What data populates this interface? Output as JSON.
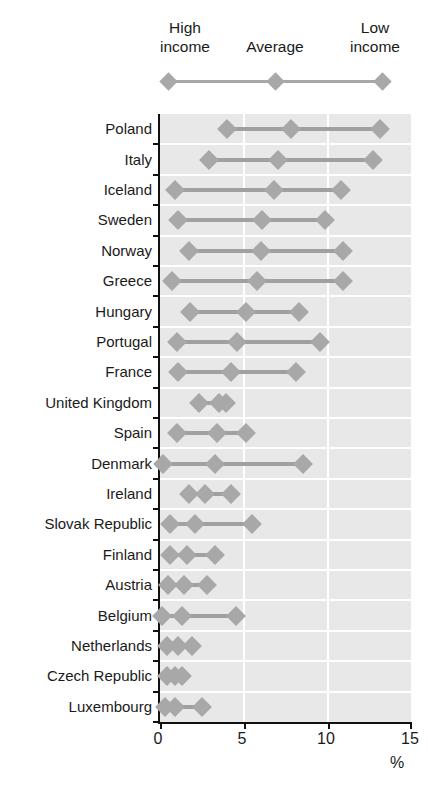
{
  "title": "",
  "legend": {
    "high_income": "High\nincome",
    "average": "Average",
    "low_income": "Low\nincome"
  },
  "axis": {
    "x_ticks": [
      "0",
      "5",
      "10",
      "15"
    ],
    "x_unit": "%"
  },
  "colors": {
    "marker": "#a8a8a8",
    "line": "#a0a0a0",
    "plot_background": "#e8e8e8",
    "gridline": "#ffffff",
    "axis": "#111111",
    "text": "#1a1a1a"
  },
  "chart_data": {
    "type": "scatter",
    "title": "",
    "xlabel": "%",
    "ylabel": "",
    "xlim": [
      0,
      15
    ],
    "x_ticks": [
      0,
      5,
      10,
      15
    ],
    "grid": true,
    "legend_position": "top",
    "series": [
      {
        "name": "High income"
      },
      {
        "name": "Average"
      },
      {
        "name": "Low income"
      }
    ],
    "categories": [
      "Poland",
      "Italy",
      "Iceland",
      "Sweden",
      "Norway",
      "Greece",
      "Hungary",
      "Portugal",
      "France",
      "United Kingdom",
      "Spain",
      "Denmark",
      "Ireland",
      "Slovak Republic",
      "Finland",
      "Austria",
      "Belgium",
      "Netherlands",
      "Czech Republic",
      "Luxembourg"
    ],
    "rows": [
      {
        "category": "Poland",
        "high": 4.0,
        "average": 7.8,
        "low": 13.1
      },
      {
        "category": "Italy",
        "high": 2.9,
        "average": 7.0,
        "low": 12.7
      },
      {
        "category": "Iceland",
        "high": 0.9,
        "average": 6.8,
        "low": 10.8
      },
      {
        "category": "Sweden",
        "high": 1.1,
        "average": 6.1,
        "low": 9.8
      },
      {
        "category": "Norway",
        "high": 1.7,
        "average": 6.0,
        "low": 10.9
      },
      {
        "category": "Greece",
        "high": 0.7,
        "average": 5.8,
        "low": 10.9
      },
      {
        "category": "Hungary",
        "high": 1.8,
        "average": 5.1,
        "low": 8.3
      },
      {
        "category": "Portugal",
        "high": 1.0,
        "average": 4.6,
        "low": 9.5
      },
      {
        "category": "France",
        "high": 1.1,
        "average": 4.2,
        "low": 8.1
      },
      {
        "category": "United Kingdom",
        "high": 2.3,
        "average": 3.5,
        "low": 3.9
      },
      {
        "category": "Spain",
        "high": 1.0,
        "average": 3.4,
        "low": 5.1
      },
      {
        "category": "Denmark",
        "high": 0.2,
        "average": 3.3,
        "low": 8.5
      },
      {
        "category": "Ireland",
        "high": 1.7,
        "average": 2.7,
        "low": 4.2
      },
      {
        "category": "Slovak Republic",
        "high": 0.6,
        "average": 2.1,
        "low": 5.5
      },
      {
        "category": "Finland",
        "high": 0.6,
        "average": 1.6,
        "low": 3.3
      },
      {
        "category": "Austria",
        "high": 0.5,
        "average": 1.4,
        "low": 2.8
      },
      {
        "category": "Belgium",
        "high": 0.1,
        "average": 1.3,
        "low": 4.5
      },
      {
        "category": "Netherlands",
        "high": 0.4,
        "average": 1.1,
        "low": 1.9
      },
      {
        "category": "Czech Republic",
        "high": 0.4,
        "average": 0.9,
        "low": 1.3
      },
      {
        "category": "Luxembourg",
        "high": 0.3,
        "average": 0.9,
        "low": 2.5
      }
    ]
  }
}
